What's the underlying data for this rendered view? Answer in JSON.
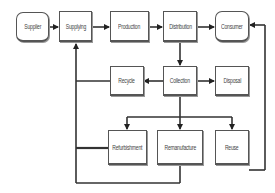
{
  "diagram": {
    "title": "",
    "nodes": [
      {
        "id": "supplier",
        "label": "Supplier",
        "shape": "rounded"
      },
      {
        "id": "supplying",
        "label": "Supplying",
        "shape": "rect"
      },
      {
        "id": "production",
        "label": "Production",
        "shape": "rect"
      },
      {
        "id": "distribution",
        "label": "Distribution",
        "shape": "rect"
      },
      {
        "id": "consumer",
        "label": "Consumer",
        "shape": "rounded"
      },
      {
        "id": "recycle",
        "label": "Recycle",
        "shape": "rect"
      },
      {
        "id": "collection",
        "label": "Collection",
        "shape": "rect"
      },
      {
        "id": "disposal",
        "label": "Disposal",
        "shape": "rect"
      },
      {
        "id": "refurbishment",
        "label": "Refurbishment",
        "shape": "rect"
      },
      {
        "id": "remanufacture",
        "label": "Remanufacture",
        "shape": "rect"
      },
      {
        "id": "reuse",
        "label": "Reuse",
        "shape": "rect"
      }
    ],
    "edges": [
      {
        "from": "supplier",
        "to": "supplying"
      },
      {
        "from": "supplying",
        "to": "production"
      },
      {
        "from": "production",
        "to": "distribution"
      },
      {
        "from": "distribution",
        "to": "consumer"
      },
      {
        "from": "distribution",
        "to": "collection"
      },
      {
        "from": "collection",
        "to": "recycle"
      },
      {
        "from": "collection",
        "to": "disposal"
      },
      {
        "from": "collection",
        "to": "refurbishment"
      },
      {
        "from": "collection",
        "to": "remanufacture"
      },
      {
        "from": "collection",
        "to": "reuse"
      },
      {
        "from": "recycle",
        "to": "supplying"
      },
      {
        "from": "refurbishment",
        "to": "supplying"
      },
      {
        "from": "remanufacture",
        "to": "supplying"
      },
      {
        "from": "reuse",
        "to": "consumer"
      }
    ],
    "colors": {
      "line": "#333333",
      "border": "#555555",
      "text": "#444444",
      "background": "#ffffff"
    }
  }
}
